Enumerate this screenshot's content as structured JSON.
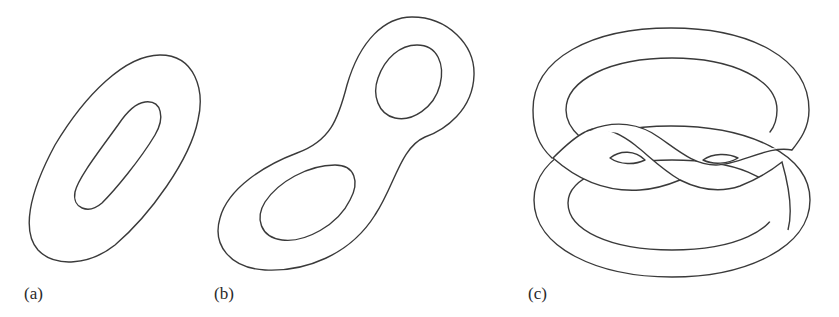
{
  "figure": {
    "panels": [
      {
        "id": "a",
        "label": "(a)",
        "description": "annulus / single-holed surface"
      },
      {
        "id": "b",
        "label": "(b)",
        "description": "two-holed surface"
      },
      {
        "id": "c",
        "label": "(c)",
        "description": "interlinked band surface"
      }
    ],
    "line_color": "#3a3a3a",
    "background": "#ffffff"
  }
}
